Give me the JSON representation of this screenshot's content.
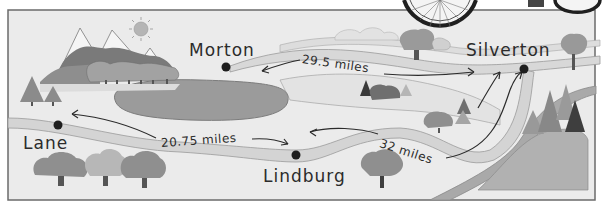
{
  "map": {
    "towns": [
      {
        "name": "Morton",
        "x": 226,
        "y": 67
      },
      {
        "name": "Silverton",
        "x": 524,
        "y": 69
      },
      {
        "name": "Lane",
        "x": 58,
        "y": 125
      },
      {
        "name": "Lindburg",
        "x": 296,
        "y": 155
      }
    ],
    "routes": [
      {
        "from": "Morton",
        "to": "Silverton",
        "label": "29.5 miles",
        "distance": 29.5
      },
      {
        "from": "Lane",
        "to": "Lindburg",
        "label": "20.75 miles",
        "distance": 20.75
      },
      {
        "from": "Lindburg",
        "to": "Silverton",
        "label": "32 miles",
        "distance": 32
      }
    ],
    "unit": "miles",
    "colors": {
      "background": "#e9e9e9",
      "border": "#6b6b6b",
      "road": "#d6d6d6",
      "lake": "#9a9a9a",
      "text": "#2b2b2b",
      "dot": "#1e1e1e"
    }
  }
}
